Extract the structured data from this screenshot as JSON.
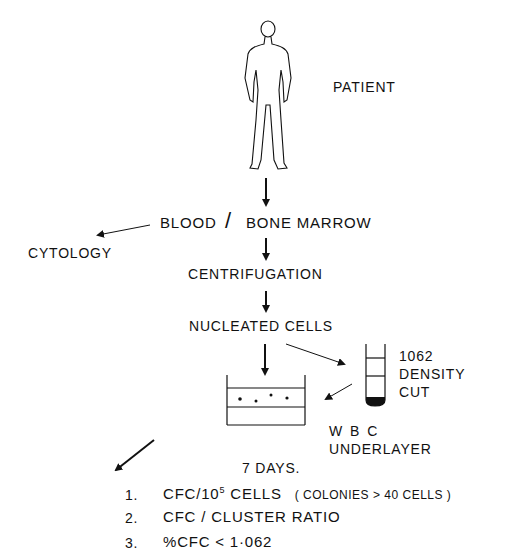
{
  "diagram": {
    "patient_label": "PATIENT",
    "sample_label_left": "BLOOD",
    "sample_separator": "/",
    "sample_label_right": "BONE MARROW",
    "cytology_label": "CYTOLOGY",
    "centrifugation_label": "CENTRIFUGATION",
    "nucleated_cells_label": "NUCLEATED CELLS",
    "density_cut": {
      "value": "1062",
      "line1": "DENSITY",
      "line2": "CUT"
    },
    "underlayer": {
      "line1": "W B C",
      "line2": "UNDERLAYER"
    },
    "incubation_label": "7 DAYS.",
    "outcomes": [
      {
        "num": "1.",
        "main": "CFC/10",
        "sup": "5",
        "rest": " CELLS",
        "note": "( COLONIES > 40 CELLS )"
      },
      {
        "num": "2.",
        "main": "CFC / CLUSTER RATIO"
      },
      {
        "num": "3.",
        "main": "%CFC < 1·062"
      }
    ]
  }
}
